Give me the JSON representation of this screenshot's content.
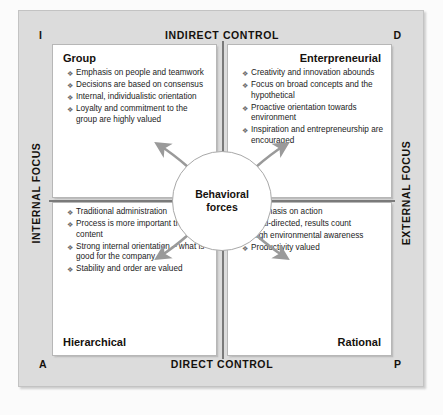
{
  "diagram": {
    "center": {
      "line1": "Behavioral",
      "line2": "forces"
    },
    "axes": {
      "top": "INDIRECT CONTROL",
      "bottom": "DIRECT CONTROL",
      "left": "INTERNAL FOCUS",
      "right": "EXTERNAL FOCUS"
    },
    "corners": {
      "top_left": "I",
      "top_right": "D",
      "bottom_left": "A",
      "bottom_right": "P"
    },
    "quadrants": [
      {
        "id": "group",
        "title": "Group",
        "title_align": "left",
        "title_position": "top",
        "bullets": [
          "Emphasis on people and teamwork",
          "Decisions are based on consensus",
          "Internal, individualistic orientation",
          "Loyalty and commitment to the group are highly valued"
        ]
      },
      {
        "id": "enterpreneurial",
        "title": "Enterpreneurial",
        "title_align": "right",
        "title_position": "top",
        "bullets": [
          "Creativity and innovation abounds",
          "Focus on broad concepts and the hypothetical",
          "Proactive orientation towards environment",
          "Inspiration and entrepreneurship are encouraged"
        ]
      },
      {
        "id": "hierarchical",
        "title": "Hierarchical",
        "title_align": "left",
        "title_position": "bottom",
        "bullets": [
          "Traditional administration",
          "Process is more important than content",
          "Strong internal orientation – what is good for the company",
          "Stability and order are valued"
        ]
      },
      {
        "id": "rational",
        "title": "Rational",
        "title_align": "right",
        "title_position": "bottom",
        "bullets": [
          "Emphasis on action",
          "Goal-directed, results count",
          "High environmental awareness",
          "Productivity valued"
        ]
      }
    ],
    "colors": {
      "panel_background": "#dcdcdc",
      "quadrant_background": "#ffffff",
      "divider": "#7a7a7a",
      "text": "#15110d",
      "bullet": "#6d6d6d"
    }
  }
}
